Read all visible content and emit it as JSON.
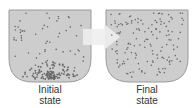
{
  "diagram": {
    "colors": {
      "container_fill": "#cdcdcd",
      "container_stroke": "#9a9a9a",
      "particle": "#6a6a6a",
      "arrow": "#eeeeee"
    },
    "initial": {
      "label_line1": "Initial",
      "label_line2": "state"
    },
    "final": {
      "label_line1": "Final",
      "label_line2": "state"
    }
  }
}
